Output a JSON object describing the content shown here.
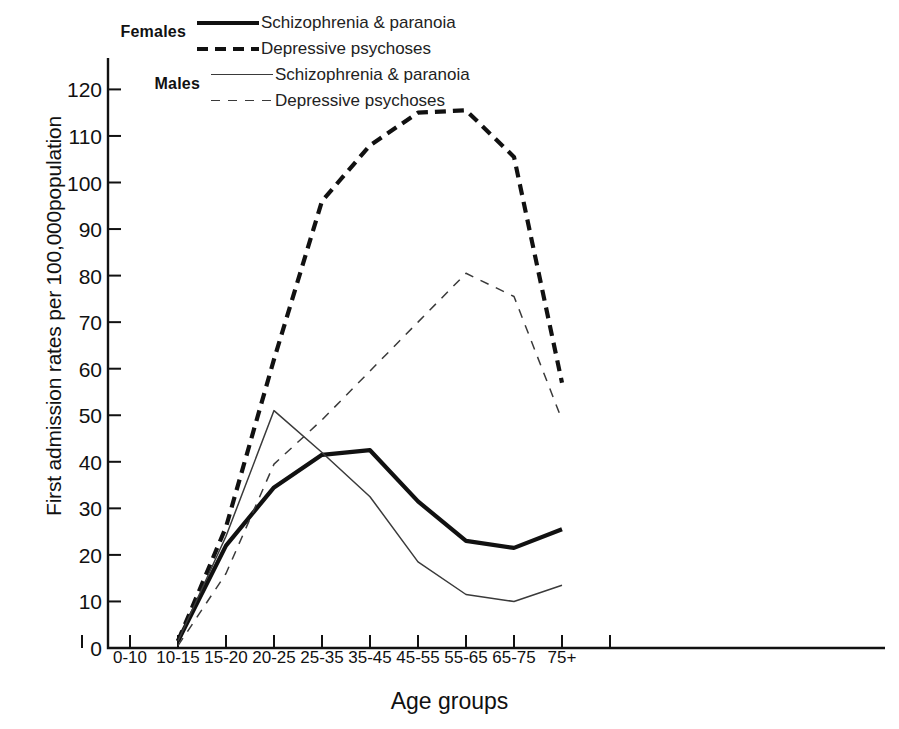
{
  "legend": {
    "groups": [
      {
        "name": "Females",
        "entries": [
          {
            "label": "Schizophrenia & paranoia",
            "style": "sw-solid-thick"
          },
          {
            "label": "Depressive psychoses",
            "style": "sw-dash-thick"
          }
        ]
      },
      {
        "name": "Males",
        "entries": [
          {
            "label": "Schizophrenia & paranoia",
            "style": "sw-solid-thin"
          },
          {
            "label": "Depressive psychoses",
            "style": "sw-dash-thin"
          }
        ]
      }
    ]
  },
  "chart_data": {
    "type": "line",
    "title": "",
    "xlabel": "Age groups",
    "ylabel": "First admission rates per 100,000population",
    "categories": [
      "0-10",
      "10-15",
      "15-20",
      "20-25",
      "25-35",
      "35-45",
      "45-55",
      "55-65",
      "65-75",
      "75+"
    ],
    "ylim": [
      0,
      125
    ],
    "yticks": [
      0,
      10,
      20,
      30,
      40,
      50,
      60,
      70,
      80,
      90,
      100,
      110,
      120
    ],
    "grid": false,
    "legend_position": "top-left",
    "series": [
      {
        "name": "Females — Schizophrenia & paranoia",
        "group": "Females",
        "style": "solid-thick",
        "color": "#111111",
        "x": [
          "10-15",
          "15-20",
          "20-25",
          "25-35",
          "35-45",
          "45-55",
          "55-65",
          "65-75",
          "75+"
        ],
        "values": [
          1.5,
          22,
          34.5,
          41.5,
          42.5,
          31.5,
          23,
          21.5,
          25.5
        ]
      },
      {
        "name": "Females — Depressive psychoses",
        "group": "Females",
        "style": "dash-thick",
        "color": "#111111",
        "x": [
          "10-15",
          "15-20",
          "20-25",
          "25-35",
          "35-45",
          "45-55",
          "55-65",
          "65-75",
          "75+"
        ],
        "values": [
          1.5,
          26,
          62,
          96,
          108,
          115,
          115.5,
          105.5,
          57
        ]
      },
      {
        "name": "Males — Schizophrenia & paranoia",
        "group": "Males",
        "style": "solid-thin",
        "color": "#3a3a3a",
        "x": [
          "10-15",
          "15-20",
          "20-25",
          "25-35",
          "35-45",
          "45-55",
          "55-65",
          "65-75",
          "75+"
        ],
        "values": [
          1.5,
          24,
          51,
          42,
          32.5,
          18.5,
          11.5,
          10,
          13.5
        ]
      },
      {
        "name": "Males — Depressive psychoses",
        "group": "Males",
        "style": "dash-thin",
        "color": "#3a3a3a",
        "x": [
          "10-15",
          "15-20",
          "20-25",
          "25-35",
          "35-45",
          "45-55",
          "55-65",
          "65-75",
          "75+"
        ],
        "values": [
          0.5,
          16,
          39.5,
          49,
          59.5,
          70,
          80.5,
          75.5,
          49
        ]
      }
    ]
  }
}
